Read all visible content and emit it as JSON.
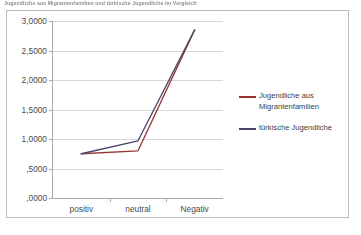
{
  "caption": {
    "text": "Jugendliche aus Migrantenfamilien und türkische Jugendliche im Vergleich"
  },
  "colors": {
    "series_migranten": "#963634",
    "series_tuerkische": "#4a4570",
    "gridline": "#d7d9db",
    "axis": "#a8abad",
    "frame_border": "#b9bcbe",
    "text": "#4a4a4a",
    "plot_background": "#ffffff"
  },
  "chart_data": {
    "type": "line",
    "title": "",
    "xlabel": "",
    "ylabel": "",
    "categories": [
      "positiv",
      "neutral",
      "Negativ"
    ],
    "series": [
      {
        "name": "Jugendliche aus Migrantenfamilien",
        "color": "#963634",
        "values": [
          0.75,
          0.8,
          2.85
        ]
      },
      {
        "name": "türkische Jugendliche",
        "color": "#4a4570",
        "values": [
          0.75,
          0.97,
          2.85
        ]
      }
    ],
    "ylim": [
      0,
      3
    ],
    "ytick_values": [
      0,
      0.5,
      1,
      1.5,
      2,
      2.5,
      3
    ],
    "ytick_labels": [
      ",0000",
      ",5000",
      "1,0000",
      "1,5000",
      "2,0000",
      "2,5000",
      "3,0000"
    ],
    "grid": true,
    "legend_position": "right",
    "legend": [
      "Jugendliche aus Migrantenfamilien",
      "türkische Jugendliche"
    ]
  }
}
